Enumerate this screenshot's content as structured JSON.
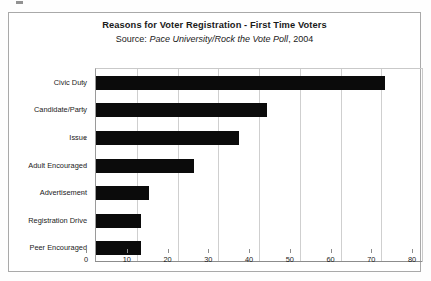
{
  "chart_data": {
    "type": "bar",
    "orientation": "horizontal",
    "title": "Reasons for Voter Registration - First Time Voters",
    "source": {
      "label": "Source:",
      "publication": "Pace University/Rock the Vote Poll",
      "year": ", 2004",
      "full": "Source: Pace University/Rock the Vote Poll, 2004"
    },
    "categories": [
      "Civic Duty",
      "Candidate/Party",
      "Issue",
      "Adult Encouraged",
      "Advertisement",
      "Registration Drive",
      "Peer Encouraged"
    ],
    "values": [
      71,
      42,
      35,
      24,
      13,
      11,
      11
    ],
    "xlabel": "",
    "ylabel": "",
    "xlim": [
      0,
      80
    ],
    "xticks": [
      0,
      10,
      20,
      30,
      40,
      50,
      60,
      70,
      80
    ],
    "xtick_labels": [
      "0",
      "10",
      "20",
      "30",
      "40",
      "50",
      "60",
      "70",
      "80"
    ],
    "grid": "vertical",
    "legend": "none",
    "bar_color": "#0b0b0b",
    "background_color": "#ffffff",
    "frame_color": "#a9a9a9",
    "gridline_color": "#cfcfcf"
  }
}
